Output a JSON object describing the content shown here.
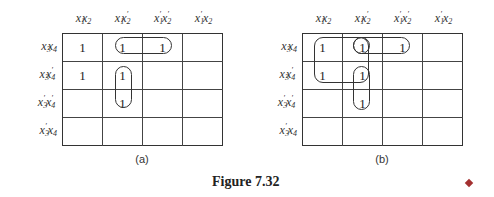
{
  "figure": {
    "caption": "Figure 7.32",
    "end_marker_color": "#a33030"
  },
  "column_headers": [
    {
      "a": "x",
      "a_sub": "1",
      "a_prime": "",
      "b": "x",
      "b_sub": "2",
      "b_prime": ""
    },
    {
      "a": "x",
      "a_sub": "1",
      "a_prime": "",
      "b": "x",
      "b_sub": "2",
      "b_prime": "′"
    },
    {
      "a": "x",
      "a_sub": "1",
      "a_prime": "′",
      "b": "x",
      "b_sub": "2",
      "b_prime": "′"
    },
    {
      "a": "x",
      "a_sub": "1",
      "a_prime": "′",
      "b": "x",
      "b_sub": "2",
      "b_prime": ""
    }
  ],
  "row_headers": [
    {
      "a": "x",
      "a_sub": "3",
      "a_prime": "",
      "b": "x",
      "b_sub": "4",
      "b_prime": ""
    },
    {
      "a": "x",
      "a_sub": "3",
      "a_prime": "",
      "b": "x",
      "b_sub": "4",
      "b_prime": "′"
    },
    {
      "a": "x",
      "a_sub": "3",
      "a_prime": "′",
      "b": "x",
      "b_sub": "4",
      "b_prime": "′"
    },
    {
      "a": "x",
      "a_sub": "3",
      "a_prime": "′",
      "b": "x",
      "b_sub": "4",
      "b_prime": ""
    }
  ],
  "maps": [
    {
      "label": "(a)",
      "cells": [
        [
          "1",
          "1",
          "1",
          ""
        ],
        [
          "1",
          "1",
          "",
          ""
        ],
        [
          "",
          "1",
          "",
          ""
        ],
        [
          "",
          "",
          "",
          ""
        ]
      ],
      "loops": [
        {
          "description": "row x3x4, columns x1x2' and x1'x2'"
        },
        {
          "description": "column x1x2', rows x3x4' and x3'x4'"
        }
      ]
    },
    {
      "label": "(b)",
      "cells": [
        [
          "1",
          "1",
          "1",
          ""
        ],
        [
          "1",
          "1",
          "",
          ""
        ],
        [
          "",
          "1",
          "",
          ""
        ],
        [
          "",
          "",
          "",
          ""
        ]
      ],
      "loops": [
        {
          "description": "quad: rows x3x4,x3x4' and columns x1x2,x1x2'"
        },
        {
          "description": "row x3x4, columns x1x2' and x1'x2'"
        },
        {
          "description": "column x1x2', rows x3x4' and x3'x4'"
        },
        {
          "description": "single cell row x3x4, column x1x2'"
        }
      ]
    }
  ]
}
